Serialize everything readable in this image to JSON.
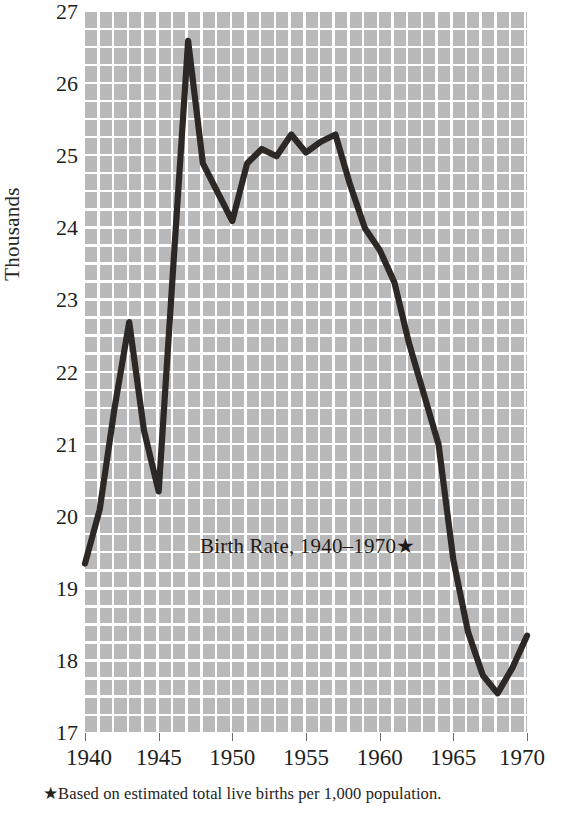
{
  "chart_data": {
    "type": "line",
    "title": "Birth Rate, 1940–1970★",
    "xlabel": "",
    "ylabel": "Thousands",
    "footnote": "★Based on estimated total live births per 1,000 population.",
    "xlim": [
      1940,
      1970
    ],
    "ylim": [
      17,
      27
    ],
    "grid": true,
    "legend": false,
    "y_ticks": [
      27,
      26,
      25,
      24,
      23,
      22,
      21,
      20,
      19,
      18,
      17
    ],
    "x_ticks": [
      1940,
      1945,
      1950,
      1955,
      1960,
      1965,
      1970
    ],
    "x_tick_labels": [
      "1940",
      "1945",
      "1950",
      "1955",
      "1960",
      "1965",
      "1970"
    ],
    "y_tick_labels": [
      "27",
      "26",
      "25",
      "24",
      "23",
      "22",
      "21",
      "20",
      "19",
      "18",
      "17"
    ],
    "line_color": "#2b2825",
    "grid_color": "#b9b9b9",
    "x": [
      1940,
      1941,
      1942,
      1943,
      1944,
      1945,
      1946,
      1947,
      1948,
      1949,
      1950,
      1951,
      1952,
      1953,
      1954,
      1955,
      1956,
      1957,
      1958,
      1959,
      1960,
      1961,
      1962,
      1963,
      1964,
      1965,
      1966,
      1967,
      1968,
      1969,
      1970
    ],
    "values": [
      19.35,
      20.1,
      21.5,
      22.7,
      21.2,
      20.35,
      23.5,
      26.6,
      24.9,
      24.5,
      24.1,
      24.9,
      25.1,
      25.0,
      25.3,
      25.05,
      25.2,
      25.3,
      24.6,
      24.0,
      23.7,
      23.25,
      22.4,
      21.7,
      21.0,
      19.4,
      18.4,
      17.8,
      17.55,
      17.9,
      18.35
    ],
    "series_name": "Birth Rate"
  },
  "axis": {
    "y_title": "Thousands"
  }
}
